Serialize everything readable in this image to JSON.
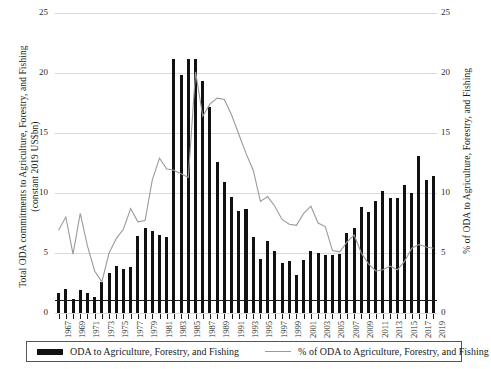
{
  "chart_data": {
    "type": "bar",
    "title": "",
    "subtitle": "",
    "xlabel": "",
    "ylabel": "Total ODA commitments to Agriculture, Forestry, and Fishing (constant 2019 US$bn)",
    "y2label": "% of ODA to Agriculture, Forestry, and Fishing",
    "ylim": [
      0,
      25
    ],
    "y2lim": [
      0,
      25
    ],
    "yticks": [
      0,
      5,
      10,
      15,
      20,
      25
    ],
    "y2ticks": [
      0,
      5,
      10,
      15,
      20,
      25
    ],
    "grid": true,
    "legend_position": "bottom",
    "x_tick_label_step": 2,
    "x_tick_labels": [
      "1967",
      "1969",
      "1971",
      "1973",
      "1975",
      "1977",
      "1979",
      "1981",
      "1983",
      "1985",
      "1987",
      "1989",
      "1991",
      "1993",
      "1995",
      "1997",
      "1999",
      "2001",
      "2003",
      "2005",
      "2007",
      "2009",
      "2011",
      "2013",
      "2015",
      "2017",
      "2019"
    ],
    "categories": [
      "1967",
      "1968",
      "1969",
      "1970",
      "1971",
      "1972",
      "1973",
      "1974",
      "1975",
      "1976",
      "1977",
      "1978",
      "1979",
      "1980",
      "1981",
      "1982",
      "1983",
      "1984",
      "1985",
      "1986",
      "1987",
      "1988",
      "1989",
      "1990",
      "1991",
      "1992",
      "1993",
      "1994",
      "1995",
      "1996",
      "1997",
      "1998",
      "1999",
      "2000",
      "2001",
      "2002",
      "2003",
      "2004",
      "2005",
      "2006",
      "2007",
      "2008",
      "2009",
      "2010",
      "2011",
      "2012",
      "2013",
      "2014",
      "2015",
      "2016",
      "2017",
      "2018",
      "2019"
    ],
    "series": [
      {
        "name": "ODA to Agriculture, Forestry, and Fishing",
        "type": "bar",
        "axis": "left",
        "units": "constant 2019 US$bn",
        "color": "#111111",
        "values": [
          1.7,
          2.0,
          1.2,
          1.9,
          1.7,
          1.3,
          2.6,
          3.3,
          3.9,
          3.7,
          3.8,
          6.4,
          7.1,
          6.8,
          6.5,
          6.3,
          21.2,
          19.8,
          21.2,
          21.2,
          19.3,
          17.2,
          12.6,
          10.9,
          9.7,
          8.5,
          8.7,
          6.3,
          4.5,
          6.0,
          5.2,
          4.2,
          4.3,
          3.2,
          4.4,
          5.2,
          5.0,
          4.8,
          4.8,
          4.9,
          6.7,
          7.1,
          8.8,
          8.4,
          9.3,
          10.2,
          9.6,
          9.6,
          10.7,
          10.0,
          13.1,
          11.1,
          11.4
        ]
      },
      {
        "name": "% of ODA to Agriculture, Forestry, and Fishing",
        "type": "line",
        "axis": "right",
        "units": "%",
        "color": "#9a9a9a",
        "values": [
          6.9,
          8.0,
          4.9,
          8.3,
          5.6,
          3.5,
          2.6,
          5.0,
          6.2,
          7.0,
          8.7,
          7.6,
          7.7,
          11.1,
          12.9,
          12.0,
          11.9,
          11.6,
          11.3,
          20.1,
          16.4,
          17.4,
          17.9,
          17.8,
          16.5,
          14.9,
          13.3,
          11.9,
          9.3,
          9.7,
          8.9,
          7.8,
          7.4,
          7.3,
          8.3,
          8.9,
          7.5,
          7.2,
          5.2,
          5.1,
          5.9,
          6.5,
          5.0,
          4.1,
          3.5,
          3.6,
          3.9,
          3.6,
          4.3,
          5.4,
          5.7,
          5.5,
          5.4
        ]
      }
    ]
  },
  "legend": {
    "bar_label": "ODA to Agriculture, Forestry, and Fishing",
    "line_label": "% of ODA to Agriculture, Forestry, and Fishing"
  },
  "axes": {
    "left_title_line1": "Total ODA commitments to Agriculture, Forestry, and Fishing",
    "left_title_line2": "(constant 2019 US$bn)",
    "right_title": "% of ODA to Agriculture, Forestry, and Fishing"
  }
}
